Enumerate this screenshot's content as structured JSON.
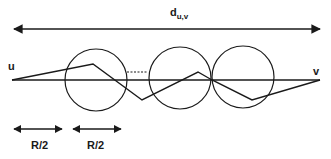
{
  "diagram": {
    "title_label": {
      "base": "d",
      "subscript": "u,v"
    },
    "node_u": "u",
    "node_v": "v",
    "left_segment_label": "R/2",
    "right_segment_label": "R/2",
    "colors": {
      "stroke": "#1a1a1a",
      "background": "#ffffff"
    },
    "circles": [
      {
        "cx": 96,
        "cy": 80,
        "r": 31
      },
      {
        "cx": 180,
        "cy": 78,
        "r": 31
      },
      {
        "cx": 243,
        "cy": 77,
        "r": 31
      }
    ],
    "zigzag_path": [
      [
        12,
        80
      ],
      [
        93,
        64
      ],
      [
        142,
        100
      ],
      [
        198,
        72
      ],
      [
        212,
        80
      ],
      [
        252,
        100
      ],
      [
        320,
        80
      ]
    ],
    "straight_line": {
      "x1": 12,
      "y1": 80,
      "x2": 320,
      "y2": 80
    },
    "distance_arrow": {
      "x1": 12,
      "y1": 29,
      "x2": 322,
      "y2": 29
    },
    "gap_dotted": {
      "x1": 127,
      "y1": 72,
      "x2": 148,
      "y2": 72
    },
    "r_half_arrows": [
      {
        "x1": 12,
        "x2": 63,
        "y": 129
      },
      {
        "x1": 71,
        "x2": 122,
        "y": 129
      }
    ]
  }
}
